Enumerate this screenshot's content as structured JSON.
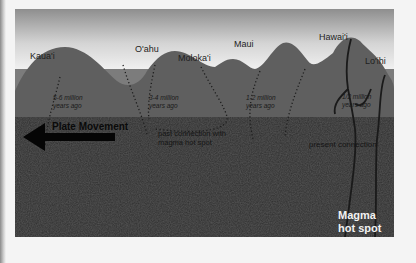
{
  "diagram": {
    "islands": [
      {
        "name": "Kaua'i",
        "age": [
          "5-6 million",
          "years ago"
        ]
      },
      {
        "name": "O'ahu",
        "age": [
          "3-4 million",
          "years ago"
        ]
      },
      {
        "name": "Moloka'i",
        "age": []
      },
      {
        "name": "Maui",
        "age": [
          "1-2 million",
          "years ago"
        ]
      },
      {
        "name": "Hawai'i",
        "age": [
          "1/2 million",
          "years ago"
        ]
      },
      {
        "name": "Lo'ihi",
        "age": []
      }
    ],
    "plate_movement_label": "Plate Movement",
    "past_connection_label": [
      "past connection with",
      "magma hot spot"
    ],
    "present_connection_label": "present connection",
    "hot_spot_label": [
      "Magma",
      "hot spot"
    ],
    "colors": {
      "sky_top": "#8e8e8e",
      "sky_bottom": "#f2f2f2",
      "ocean": "#7c7c7c",
      "island": "#5e5e5e",
      "crust": "#2f2f2f",
      "arrow": "#050505"
    }
  }
}
